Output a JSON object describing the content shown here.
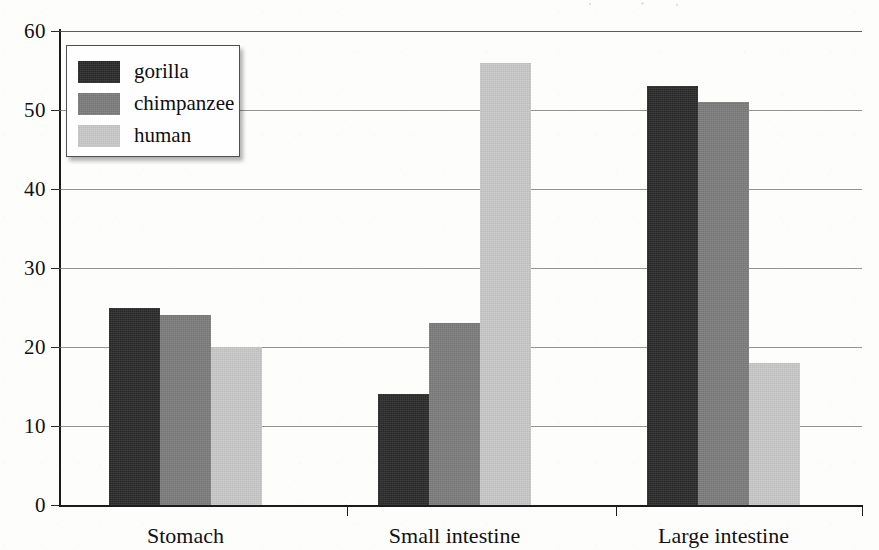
{
  "chart_data": {
    "type": "bar",
    "title": "",
    "xlabel": "",
    "ylabel": "",
    "categories": [
      "Stomach",
      "Small intestine",
      "Large intestine"
    ],
    "series": [
      {
        "name": "gorilla",
        "color": "#2b2b2b",
        "values": [
          25,
          14,
          53
        ]
      },
      {
        "name": "chimpanzee",
        "color": "#7d7d7d",
        "values": [
          24,
          23,
          51
        ]
      },
      {
        "name": "human",
        "color": "#c9c9c9",
        "values": [
          20,
          56,
          18
        ]
      }
    ],
    "ylim": [
      0,
      60
    ],
    "yticks": [
      0,
      10,
      20,
      30,
      40,
      50,
      60
    ],
    "ytick_labels": [
      "0",
      "10",
      "20",
      "30",
      "40",
      "50",
      "60"
    ],
    "grid": true,
    "legend_position": "top-left"
  },
  "legend": {
    "items": [
      {
        "label": "gorilla"
      },
      {
        "label": "chimpanzee"
      },
      {
        "label": "human"
      }
    ]
  }
}
